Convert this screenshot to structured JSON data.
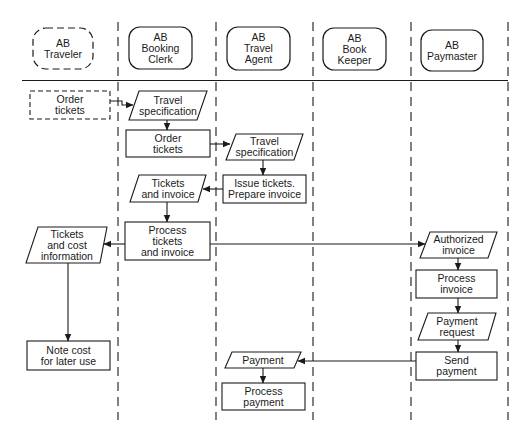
{
  "diagram": {
    "type": "swimlane-flowchart",
    "colors": {
      "stroke": "#1a1a1a",
      "background": "#ffffff"
    },
    "lanes": [
      {
        "id": "traveler",
        "label": "AB\nTraveler",
        "style": "dashed-rounded"
      },
      {
        "id": "booking_clerk",
        "label": "AB\nBooking\nClerk",
        "style": "rounded"
      },
      {
        "id": "travel_agent",
        "label": "AB\nTravel\nAgent",
        "style": "rounded"
      },
      {
        "id": "book_keeper",
        "label": "AB\nBook\nKeeper",
        "style": "rounded"
      },
      {
        "id": "paymaster",
        "label": "AB\nPaymaster",
        "style": "rounded"
      }
    ],
    "nodes": [
      {
        "id": "n1",
        "lane": "traveler",
        "shape": "dashed-rect",
        "label": "Order\ntickets"
      },
      {
        "id": "n2",
        "lane": "booking_clerk",
        "shape": "parallelogram",
        "label": "Travel\nspecification"
      },
      {
        "id": "n3",
        "lane": "booking_clerk",
        "shape": "rect",
        "label": "Order\ntickets"
      },
      {
        "id": "n4",
        "lane": "travel_agent",
        "shape": "parallelogram",
        "label": "Travel\nspecification"
      },
      {
        "id": "n5",
        "lane": "travel_agent",
        "shape": "rect",
        "label": "Issue tickets.\nPrepare invoice"
      },
      {
        "id": "n6",
        "lane": "booking_clerk",
        "shape": "parallelogram",
        "label": "Tickets\nand invoice"
      },
      {
        "id": "n7",
        "lane": "booking_clerk",
        "shape": "rect",
        "label": "Process\ntickets\nand invoice"
      },
      {
        "id": "n8",
        "lane": "traveler",
        "shape": "parallelogram",
        "label": "Tickets\nand cost\ninformation"
      },
      {
        "id": "n9",
        "lane": "paymaster",
        "shape": "parallelogram",
        "label": "Authorized\ninvoice"
      },
      {
        "id": "n10",
        "lane": "paymaster",
        "shape": "rect",
        "label": "Process\ninvoice"
      },
      {
        "id": "n11",
        "lane": "paymaster",
        "shape": "parallelogram",
        "label": "Payment\nrequest"
      },
      {
        "id": "n12",
        "lane": "paymaster",
        "shape": "rect",
        "label": "Send\npayment"
      },
      {
        "id": "n13",
        "lane": "traveler",
        "shape": "rect",
        "label": "Note cost\nfor later use"
      },
      {
        "id": "n14",
        "lane": "travel_agent",
        "shape": "parallelogram",
        "label": "Payment"
      },
      {
        "id": "n15",
        "lane": "travel_agent",
        "shape": "rect",
        "label": "Process\npayment"
      }
    ],
    "edges": [
      {
        "from": "n1",
        "to": "n2"
      },
      {
        "from": "n2",
        "to": "n3"
      },
      {
        "from": "n3",
        "to": "n4"
      },
      {
        "from": "n4",
        "to": "n5"
      },
      {
        "from": "n5",
        "to": "n6"
      },
      {
        "from": "n6",
        "to": "n7"
      },
      {
        "from": "n7",
        "to": "n8"
      },
      {
        "from": "n7",
        "to": "n9"
      },
      {
        "from": "n8",
        "to": "n13"
      },
      {
        "from": "n9",
        "to": "n10"
      },
      {
        "from": "n10",
        "to": "n11"
      },
      {
        "from": "n11",
        "to": "n12"
      },
      {
        "from": "n12",
        "to": "n14"
      },
      {
        "from": "n14",
        "to": "n15"
      }
    ]
  }
}
